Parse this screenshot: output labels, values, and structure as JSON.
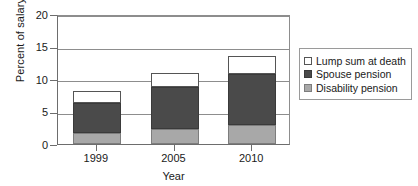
{
  "chart_data": {
    "type": "bar",
    "stacked": true,
    "title": "",
    "xlabel": "Year",
    "ylabel": "Percent of salary",
    "categories": [
      "1999",
      "2005",
      "2010"
    ],
    "ylim": [
      0,
      20
    ],
    "yticks": [
      0,
      5,
      10,
      15,
      20
    ],
    "ytick_labels": [
      "0",
      "5",
      "10",
      "15",
      "20"
    ],
    "grid": true,
    "grid_axis": "y",
    "legend_position": "right",
    "series": [
      {
        "name": "Lump sum at death",
        "color": "#ffffff",
        "values": [
          1.9,
          2.2,
          2.8
        ]
      },
      {
        "name": "Spouse pension",
        "color": "#4a4a4a",
        "values": [
          4.6,
          6.4,
          7.8
        ]
      },
      {
        "name": "Disability pension",
        "color": "#a8a8a8",
        "values": [
          1.7,
          2.3,
          2.9
        ]
      }
    ],
    "stack_order_bottom_to_top": [
      "Disability pension",
      "Spouse pension",
      "Lump sum at death"
    ],
    "cumulative_tops": {
      "1999": {
        "disability": 1.7,
        "spouse": 6.3,
        "total": 8.2
      },
      "2005": {
        "disability": 2.3,
        "spouse": 8.7,
        "total": 10.9
      },
      "2010": {
        "disability": 2.9,
        "spouse": 10.7,
        "total": 13.5
      }
    }
  },
  "legend": {
    "items": [
      {
        "label": "Lump sum at death"
      },
      {
        "label": "Spouse pension"
      },
      {
        "label": "Disability pension"
      }
    ]
  }
}
